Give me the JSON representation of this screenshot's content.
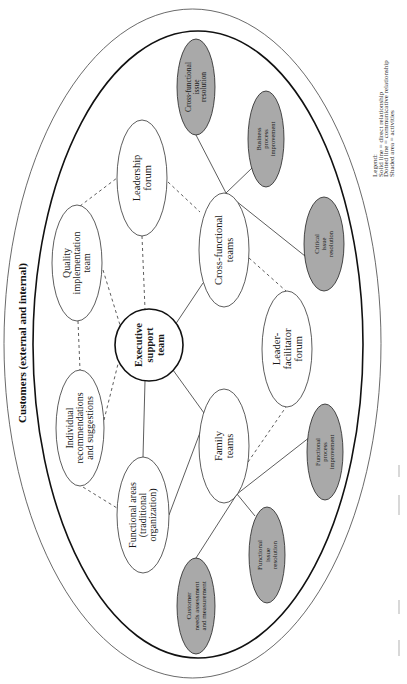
{
  "diagram": {
    "boundary_label": "Customers (external and internal)",
    "colors": {
      "shaded_fill": "#a9a9a9",
      "node_fill": "#ffffff",
      "stroke": "#222222"
    },
    "legend": {
      "title": "Legend:",
      "lines": [
        "Solid line = direct relationship",
        "Dotted line = communicative relationship",
        "Shaded area = activities"
      ]
    },
    "nodes": {
      "executive": {
        "lines": [
          "Executive",
          "support",
          "team"
        ],
        "shaded": false
      },
      "quality": {
        "lines": [
          "Quality",
          "implementation",
          "team"
        ],
        "shaded": false
      },
      "individual": {
        "lines": [
          "Individual",
          "recommendations",
          "and suggestions"
        ],
        "shaded": false
      },
      "functional_areas": {
        "lines": [
          "Functional areas",
          "(traditional",
          "organization)"
        ],
        "shaded": false
      },
      "leadership": {
        "lines": [
          "Leadership",
          "forum"
        ],
        "shaded": false
      },
      "cross_teams": {
        "lines": [
          "Cross-functional",
          "teams"
        ],
        "shaded": false
      },
      "leader_facilitator": {
        "lines": [
          "Leader-",
          "facilitator",
          "forum"
        ],
        "shaded": false
      },
      "family": {
        "lines": [
          "Family",
          "teams"
        ],
        "shaded": false
      },
      "cross_issue": {
        "lines": [
          "Cross-functional",
          "issue",
          "resolution"
        ],
        "shaded": true
      },
      "business_process": {
        "lines": [
          "Business",
          "process",
          "improvement"
        ],
        "shaded": true
      },
      "critical_issue": {
        "lines": [
          "Critical",
          "issue",
          "resolution"
        ],
        "shaded": true
      },
      "functional_process": {
        "lines": [
          "Functional",
          "process",
          "improvement"
        ],
        "shaded": true
      },
      "functional_issue": {
        "lines": [
          "Functional",
          "issue",
          "resolution"
        ],
        "shaded": true
      },
      "customer_needs": {
        "lines": [
          "Customer",
          "needs assessment",
          "and measurement"
        ],
        "shaded": true
      }
    }
  }
}
